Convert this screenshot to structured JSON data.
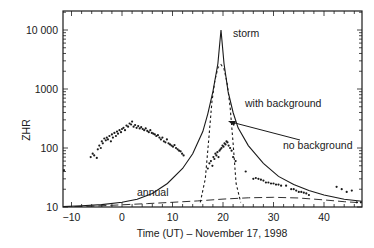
{
  "chart_data": {
    "type": "line",
    "title": "",
    "xlabel": "Time (UT) – November 17, 1998",
    "ylabel": "ZHR",
    "xlim": [
      -11.8,
      47.5
    ],
    "ylim": [
      10,
      12000
    ],
    "yscale": "log",
    "grid": false,
    "legend": "none (inline annotations)",
    "x_ticks": [
      -10,
      0,
      10,
      20,
      30,
      40
    ],
    "x_tick_labels": [
      "−10",
      "0",
      "10",
      "20",
      "30",
      "40"
    ],
    "y_ticks": [
      10,
      100,
      1000,
      10000
    ],
    "y_tick_labels": [
      "10",
      "100",
      "1000",
      "10 000"
    ],
    "annotations": [
      {
        "text": "storm",
        "x": 23,
        "y": 9000
      },
      {
        "text": "with background",
        "x": 28,
        "y": 900
      },
      {
        "text": "no background",
        "x": 28.5,
        "y": 110,
        "arrow_to": [
          21,
          240
        ]
      },
      {
        "text": "annual",
        "x": 6,
        "y": 16
      }
    ],
    "series": [
      {
        "name": "with background",
        "style": "solid",
        "x": [
          -11.8,
          -8,
          -4,
          0,
          3,
          6,
          9,
          12,
          14,
          16,
          17,
          18,
          19,
          19.6,
          20.2,
          21,
          22,
          23,
          25,
          28,
          31,
          34,
          37,
          40,
          44,
          47.5
        ],
        "y": [
          10.2,
          10.5,
          11,
          12,
          13.5,
          17,
          25,
          45,
          80,
          190,
          380,
          900,
          2700,
          10000,
          2700,
          900,
          400,
          220,
          110,
          55,
          33,
          24,
          19,
          16,
          13.5,
          12.5
        ]
      },
      {
        "name": "no background",
        "style": "dotted",
        "x": [
          15.5,
          16.5,
          17.2,
          17.8,
          18.4,
          19,
          19.6,
          20.2,
          20.8,
          21.4,
          22,
          22.6,
          23.5
        ],
        "y": [
          12,
          30,
          150,
          600,
          1400,
          2300,
          2600,
          2200,
          1300,
          500,
          120,
          25,
          12
        ]
      },
      {
        "name": "annual",
        "style": "dashed",
        "x": [
          -11.8,
          -5,
          0,
          5,
          10,
          15,
          20,
          25,
          30,
          35,
          40,
          44,
          47.5
        ],
        "y": [
          10,
          10.4,
          10.9,
          11.4,
          12,
          12.7,
          13.6,
          14.3,
          14.6,
          14.2,
          13.2,
          12.3,
          11.8
        ]
      },
      {
        "name": "observations",
        "style": "points",
        "x": [
          -11.5,
          -6.2,
          -5.8,
          -5.5,
          -5.0,
          -4.8,
          -4.5,
          -4.2,
          -4.0,
          -3.8,
          -3.5,
          -3.2,
          -3.0,
          -2.8,
          -2.5,
          -2.2,
          -2.0,
          -1.8,
          -1.5,
          -1.2,
          -1.0,
          -0.8,
          -0.5,
          -0.2,
          0.0,
          0.3,
          0.6,
          0.9,
          1.2,
          1.5,
          1.8,
          2.0,
          2.3,
          2.6,
          2.9,
          3.2,
          3.5,
          3.8,
          4.1,
          4.4,
          4.7,
          5.0,
          5.3,
          5.6,
          5.9,
          6.2,
          6.5,
          6.8,
          7.1,
          7.4,
          7.7,
          8.0,
          8.3,
          8.6,
          8.9,
          9.2,
          9.5,
          9.8,
          10.1,
          10.4,
          10.7,
          11.0,
          11.3,
          11.6,
          11.9,
          12.2,
          17.0,
          17.3,
          17.6,
          17.9,
          18.1,
          18.3,
          18.5,
          18.7,
          18.9,
          19.1,
          19.3,
          19.5,
          19.7,
          19.9,
          20.1,
          20.3,
          20.5,
          20.7,
          20.9,
          21.1,
          21.4,
          21.7,
          22.0,
          22.5,
          24.5,
          26.0,
          26.5,
          27.0,
          27.5,
          28.0,
          28.5,
          29.0,
          29.5,
          30.0,
          30.5,
          31.0,
          31.5,
          32.5,
          33.5,
          34.0,
          34.5,
          35.0,
          35.5,
          36.0,
          36.5,
          37.0,
          42.5,
          43.5,
          44.5,
          45.5,
          46.5,
          47.3
        ],
        "y": [
          42,
          70,
          80,
          75,
          68,
          95,
          110,
          100,
          130,
          120,
          145,
          135,
          150,
          140,
          160,
          130,
          170,
          150,
          180,
          160,
          190,
          175,
          200,
          185,
          210,
          220,
          200,
          240,
          230,
          260,
          250,
          280,
          230,
          245,
          220,
          235,
          215,
          225,
          210,
          200,
          215,
          195,
          185,
          200,
          180,
          175,
          170,
          160,
          165,
          150,
          140,
          150,
          130,
          125,
          140,
          120,
          115,
          110,
          105,
          112,
          100,
          95,
          90,
          88,
          80,
          75,
          45,
          55,
          60,
          50,
          70,
          65,
          80,
          75,
          85,
          70,
          90,
          95,
          100,
          110,
          105,
          120,
          115,
          130,
          125,
          110,
          100,
          90,
          70,
          60,
          40,
          30,
          31,
          30,
          29,
          28,
          26,
          26,
          25,
          25,
          24,
          24,
          23,
          23,
          20,
          20,
          19,
          18,
          18,
          17.5,
          17,
          16,
          22,
          20,
          18,
          19,
          12,
          12
        ]
      }
    ]
  },
  "colors": {
    "ink": "#1a1a1a",
    "background": "#ffffff"
  }
}
